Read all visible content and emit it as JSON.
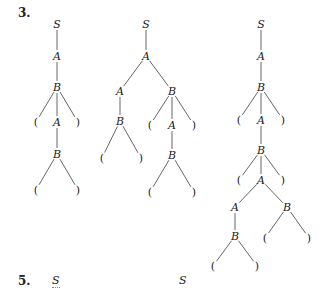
{
  "problem_numbers": [
    {
      "label": "3.",
      "x": 18,
      "y": 14
    },
    {
      "label": "5.",
      "x": 18,
      "y": 282
    }
  ],
  "bottom_roots": [
    {
      "label": "S",
      "x": 54,
      "y": 282,
      "underlined": true
    },
    {
      "label": "S",
      "x": 181,
      "y": 282,
      "underlined": false
    }
  ],
  "colors": {
    "text": "#222222",
    "edge": "#555555",
    "background": "#ffffff"
  },
  "trees": [
    {
      "name": "tree-1",
      "nodes": [
        {
          "id": "n1",
          "label": "S",
          "x": 57,
          "y": 24
        },
        {
          "id": "n2",
          "label": "A",
          "x": 57,
          "y": 56
        },
        {
          "id": "n3",
          "label": "B",
          "x": 57,
          "y": 87
        },
        {
          "id": "n4",
          "label": "(",
          "x": 36,
          "y": 122
        },
        {
          "id": "n5",
          "label": "A",
          "x": 57,
          "y": 122
        },
        {
          "id": "n6",
          "label": ")",
          "x": 78,
          "y": 122
        },
        {
          "id": "n7",
          "label": "B",
          "x": 57,
          "y": 154
        },
        {
          "id": "n8",
          "label": "(",
          "x": 36,
          "y": 190
        },
        {
          "id": "n9",
          "label": ")",
          "x": 78,
          "y": 190
        }
      ],
      "edges": [
        [
          "n1",
          "n2"
        ],
        [
          "n2",
          "n3"
        ],
        [
          "n3",
          "n4"
        ],
        [
          "n3",
          "n5"
        ],
        [
          "n3",
          "n6"
        ],
        [
          "n5",
          "n7"
        ],
        [
          "n7",
          "n8"
        ],
        [
          "n7",
          "n9"
        ]
      ]
    },
    {
      "name": "tree-2",
      "nodes": [
        {
          "id": "m1",
          "label": "S",
          "x": 146,
          "y": 24
        },
        {
          "id": "m2",
          "label": "A",
          "x": 146,
          "y": 56
        },
        {
          "id": "m3",
          "label": "A",
          "x": 120,
          "y": 91
        },
        {
          "id": "m4",
          "label": "B",
          "x": 172,
          "y": 91
        },
        {
          "id": "m5",
          "label": "B",
          "x": 120,
          "y": 121
        },
        {
          "id": "m6",
          "label": "(",
          "x": 102,
          "y": 158
        },
        {
          "id": "m7",
          "label": ")",
          "x": 141,
          "y": 158
        },
        {
          "id": "m8",
          "label": "(",
          "x": 150,
          "y": 125
        },
        {
          "id": "m9",
          "label": "A",
          "x": 172,
          "y": 125
        },
        {
          "id": "m10",
          "label": ")",
          "x": 194,
          "y": 125
        },
        {
          "id": "m11",
          "label": "B",
          "x": 172,
          "y": 155
        },
        {
          "id": "m12",
          "label": "(",
          "x": 150,
          "y": 192
        },
        {
          "id": "m13",
          "label": ")",
          "x": 194,
          "y": 192
        }
      ],
      "edges": [
        [
          "m1",
          "m2"
        ],
        [
          "m2",
          "m3"
        ],
        [
          "m2",
          "m4"
        ],
        [
          "m3",
          "m5"
        ],
        [
          "m5",
          "m6"
        ],
        [
          "m5",
          "m7"
        ],
        [
          "m4",
          "m8"
        ],
        [
          "m4",
          "m9"
        ],
        [
          "m4",
          "m10"
        ],
        [
          "m9",
          "m11"
        ],
        [
          "m11",
          "m12"
        ],
        [
          "m11",
          "m13"
        ]
      ]
    },
    {
      "name": "tree-3",
      "nodes": [
        {
          "id": "k1",
          "label": "S",
          "x": 261,
          "y": 24
        },
        {
          "id": "k2",
          "label": "A",
          "x": 261,
          "y": 56
        },
        {
          "id": "k3",
          "label": "B",
          "x": 261,
          "y": 87
        },
        {
          "id": "k4",
          "label": "(",
          "x": 239,
          "y": 120
        },
        {
          "id": "k5",
          "label": "A",
          "x": 261,
          "y": 120
        },
        {
          "id": "k6",
          "label": ")",
          "x": 283,
          "y": 120
        },
        {
          "id": "k7",
          "label": "B",
          "x": 261,
          "y": 150
        },
        {
          "id": "k8",
          "label": "(",
          "x": 239,
          "y": 180
        },
        {
          "id": "k9",
          "label": "A",
          "x": 261,
          "y": 180
        },
        {
          "id": "k10",
          "label": ")",
          "x": 283,
          "y": 180
        },
        {
          "id": "k11",
          "label": "A",
          "x": 235,
          "y": 207
        },
        {
          "id": "k12",
          "label": "B",
          "x": 287,
          "y": 207
        },
        {
          "id": "k13",
          "label": "B",
          "x": 235,
          "y": 236
        },
        {
          "id": "k14",
          "label": "(",
          "x": 213,
          "y": 266
        },
        {
          "id": "k15",
          "label": ")",
          "x": 257,
          "y": 266
        },
        {
          "id": "k16",
          "label": "(",
          "x": 265,
          "y": 238
        },
        {
          "id": "k17",
          "label": ")",
          "x": 309,
          "y": 238
        }
      ],
      "edges": [
        [
          "k1",
          "k2"
        ],
        [
          "k2",
          "k3"
        ],
        [
          "k3",
          "k4"
        ],
        [
          "k3",
          "k5"
        ],
        [
          "k3",
          "k6"
        ],
        [
          "k5",
          "k7"
        ],
        [
          "k7",
          "k8"
        ],
        [
          "k7",
          "k9"
        ],
        [
          "k7",
          "k10"
        ],
        [
          "k9",
          "k11"
        ],
        [
          "k9",
          "k12"
        ],
        [
          "k11",
          "k13"
        ],
        [
          "k13",
          "k14"
        ],
        [
          "k13",
          "k15"
        ],
        [
          "k12",
          "k16"
        ],
        [
          "k12",
          "k17"
        ]
      ]
    }
  ]
}
